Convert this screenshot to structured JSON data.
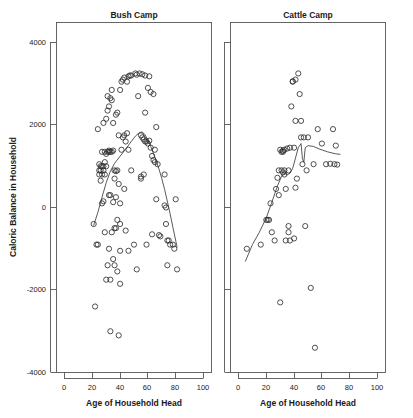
{
  "figure": {
    "background": "#ffffff",
    "point_color": "#303030",
    "line_color": "#303030",
    "axis_color": "#555555"
  },
  "chart_data": [
    {
      "type": "scatter",
      "title": "Bush Camp",
      "xlabel": "Age of Household Head",
      "ylabel": "Caloric Balance in Household",
      "xlim": [
        -4,
        108
      ],
      "ylim": [
        -4000,
        4400
      ],
      "xticks": [
        0,
        20,
        40,
        60,
        80,
        100
      ],
      "yticks": [
        4000,
        2000,
        0,
        -2000,
        -4000
      ],
      "ytick_labels": [
        "4000",
        "2000",
        "0",
        "-2000",
        "-4000"
      ],
      "xtick_labels": [
        "0",
        "20",
        "40",
        "60",
        "80",
        "100"
      ],
      "grid": false,
      "legend": "none",
      "marker": "open-circle",
      "points": [
        [
          21,
          -400
        ],
        [
          22,
          -2400
        ],
        [
          23,
          -900
        ],
        [
          24,
          -900
        ],
        [
          24,
          1900
        ],
        [
          25,
          800
        ],
        [
          25,
          900
        ],
        [
          25,
          1050
        ],
        [
          26,
          650
        ],
        [
          26,
          900
        ],
        [
          26,
          1000
        ],
        [
          27,
          100
        ],
        [
          27,
          800
        ],
        [
          27,
          1000
        ],
        [
          27,
          1350
        ],
        [
          28,
          150
        ],
        [
          28,
          900
        ],
        [
          28,
          1000
        ],
        [
          28,
          2050
        ],
        [
          29,
          -600
        ],
        [
          29,
          800
        ],
        [
          29,
          1100
        ],
        [
          29,
          1350
        ],
        [
          30,
          -1750
        ],
        [
          30,
          1000
        ],
        [
          30,
          1300
        ],
        [
          30,
          2150
        ],
        [
          31,
          -1400
        ],
        [
          31,
          1350
        ],
        [
          31,
          2700
        ],
        [
          31,
          2350
        ],
        [
          32,
          -1000
        ],
        [
          32,
          300
        ],
        [
          32,
          1350
        ],
        [
          32,
          1380
        ],
        [
          32,
          2450
        ],
        [
          33,
          -3000
        ],
        [
          33,
          -1750
        ],
        [
          33,
          300
        ],
        [
          33,
          1350
        ],
        [
          33,
          2650
        ],
        [
          34,
          -600
        ],
        [
          34,
          1350
        ],
        [
          34,
          2600
        ],
        [
          34,
          2850
        ],
        [
          35,
          -1250
        ],
        [
          35,
          130
        ],
        [
          35,
          1380
        ],
        [
          35,
          2050
        ],
        [
          36,
          -1400
        ],
        [
          36,
          700
        ],
        [
          36,
          900
        ],
        [
          36,
          -500
        ],
        [
          37,
          -500
        ],
        [
          37,
          250
        ],
        [
          37,
          880
        ],
        [
          37,
          2250
        ],
        [
          38,
          -1550
        ],
        [
          38,
          -300
        ],
        [
          38,
          900
        ],
        [
          38,
          2300
        ],
        [
          39,
          -3100
        ],
        [
          39,
          570
        ],
        [
          39,
          1750
        ],
        [
          40,
          -1850
        ],
        [
          40,
          -1050
        ],
        [
          40,
          -400
        ],
        [
          40,
          100
        ],
        [
          40,
          2850
        ],
        [
          41,
          1400
        ],
        [
          41,
          3050
        ],
        [
          42,
          1700
        ],
        [
          42,
          3100
        ],
        [
          43,
          450
        ],
        [
          43,
          1750
        ],
        [
          43,
          3150
        ],
        [
          44,
          -560
        ],
        [
          44,
          1600
        ],
        [
          45,
          1800
        ],
        [
          45,
          3050
        ],
        [
          46,
          -1050
        ],
        [
          46,
          1400
        ],
        [
          46,
          3180
        ],
        [
          47,
          3200
        ],
        [
          48,
          900
        ],
        [
          48,
          3200
        ],
        [
          50,
          -900
        ],
        [
          51,
          3250
        ],
        [
          52,
          -1500
        ],
        [
          52,
          3220
        ],
        [
          53,
          2700
        ],
        [
          54,
          3250
        ],
        [
          55,
          700
        ],
        [
          55,
          750
        ],
        [
          55,
          1750
        ],
        [
          56,
          1700
        ],
        [
          56,
          3230
        ],
        [
          57,
          800
        ],
        [
          57,
          1650
        ],
        [
          58,
          1600
        ],
        [
          58,
          2300
        ],
        [
          58,
          3200
        ],
        [
          59,
          -900
        ],
        [
          59,
          1600
        ],
        [
          60,
          1550
        ],
        [
          60,
          2900
        ],
        [
          61,
          1620
        ],
        [
          61,
          3180
        ],
        [
          62,
          1450
        ],
        [
          62,
          2800
        ],
        [
          63,
          1250
        ],
        [
          63,
          -650
        ],
        [
          64,
          1150
        ],
        [
          64,
          2750
        ],
        [
          65,
          1400
        ],
        [
          65,
          1100
        ],
        [
          66,
          200
        ],
        [
          66,
          1950
        ],
        [
          67,
          1050
        ],
        [
          68,
          -670
        ],
        [
          69,
          -700
        ],
        [
          72,
          50
        ],
        [
          72,
          800
        ],
        [
          73,
          0
        ],
        [
          73,
          -400
        ],
        [
          74,
          -1400
        ],
        [
          74,
          -800
        ],
        [
          75,
          -800
        ],
        [
          76,
          -900
        ],
        [
          78,
          -900
        ],
        [
          79,
          -1000
        ],
        [
          80,
          200
        ],
        [
          81,
          -1500
        ]
      ],
      "smoother": {
        "name": "loess",
        "points": [
          [
            21,
            -430
          ],
          [
            24,
            -120
          ],
          [
            27,
            250
          ],
          [
            30,
            600
          ],
          [
            33,
            880
          ],
          [
            36,
            1070
          ],
          [
            39,
            1200
          ],
          [
            42,
            1330
          ],
          [
            45,
            1460
          ],
          [
            48,
            1600
          ],
          [
            51,
            1730
          ],
          [
            54,
            1820
          ],
          [
            56,
            1830
          ],
          [
            58,
            1760
          ],
          [
            60,
            1640
          ],
          [
            62,
            1480
          ],
          [
            64,
            1310
          ],
          [
            66,
            1130
          ],
          [
            68,
            930
          ],
          [
            70,
            700
          ],
          [
            72,
            440
          ],
          [
            75,
            0
          ],
          [
            78,
            -480
          ],
          [
            81,
            -960
          ]
        ]
      }
    },
    {
      "type": "scatter",
      "title": "Cattle Camp",
      "xlabel": "Age of Household Head",
      "ylabel": "Caloric Balance in Household",
      "xlim": [
        -4,
        108
      ],
      "ylim": [
        -4000,
        4400
      ],
      "xticks": [
        0,
        20,
        40,
        60,
        80,
        100
      ],
      "yticks": [
        4000,
        2000,
        0,
        -2000,
        -4000
      ],
      "ytick_labels": [
        "4000",
        "2000",
        "0",
        "-2000",
        "-4000"
      ],
      "xtick_labels": [
        "0",
        "20",
        "40",
        "60",
        "80",
        "100"
      ],
      "grid": false,
      "legend": "none",
      "marker": "open-circle",
      "points": [
        [
          6,
          -1000
        ],
        [
          16,
          -900
        ],
        [
          20,
          -300
        ],
        [
          21,
          -300
        ],
        [
          22,
          -300
        ],
        [
          23,
          100
        ],
        [
          24,
          -600
        ],
        [
          26,
          -800
        ],
        [
          27,
          450
        ],
        [
          28,
          720
        ],
        [
          29,
          900
        ],
        [
          29,
          300
        ],
        [
          30,
          -2300
        ],
        [
          30,
          1400
        ],
        [
          31,
          900
        ],
        [
          31,
          1350
        ],
        [
          32,
          1350
        ],
        [
          32,
          1380
        ],
        [
          32,
          850
        ],
        [
          33,
          800
        ],
        [
          33,
          1400
        ],
        [
          33,
          900
        ],
        [
          34,
          450
        ],
        [
          34,
          -800
        ],
        [
          35,
          1430
        ],
        [
          36,
          -450
        ],
        [
          36,
          900
        ],
        [
          36,
          -600
        ],
        [
          37,
          1450
        ],
        [
          37,
          -800
        ],
        [
          38,
          2450
        ],
        [
          39,
          3050
        ],
        [
          39,
          3060
        ],
        [
          40,
          1450
        ],
        [
          40,
          -750
        ],
        [
          41,
          3100
        ],
        [
          41,
          2100
        ],
        [
          41,
          480
        ],
        [
          42,
          700
        ],
        [
          43,
          3250
        ],
        [
          44,
          2750
        ],
        [
          45,
          2100
        ],
        [
          45,
          1700
        ],
        [
          46,
          1050
        ],
        [
          47,
          1700
        ],
        [
          48,
          -450
        ],
        [
          49,
          900
        ],
        [
          50,
          1700
        ],
        [
          52,
          -1950
        ],
        [
          54,
          1050
        ],
        [
          55,
          -3400
        ],
        [
          57,
          1900
        ],
        [
          60,
          1550
        ],
        [
          63,
          1050
        ],
        [
          66,
          1060
        ],
        [
          68,
          1900
        ],
        [
          69,
          1050
        ],
        [
          70,
          1500
        ],
        [
          71,
          1040
        ]
      ],
      "smoother": {
        "name": "loess",
        "points": [
          [
            5,
            -1300
          ],
          [
            10,
            -900
          ],
          [
            15,
            -600
          ],
          [
            20,
            -250
          ],
          [
            24,
            130
          ],
          [
            28,
            520
          ],
          [
            31,
            760
          ],
          [
            33,
            830
          ],
          [
            35,
            790
          ],
          [
            37,
            830
          ],
          [
            39,
            950
          ],
          [
            41,
            1200
          ],
          [
            43,
            1450
          ],
          [
            45,
            1550
          ],
          [
            46,
            1180
          ],
          [
            47,
            1100
          ],
          [
            48,
            1450
          ],
          [
            50,
            1500
          ],
          [
            54,
            1480
          ],
          [
            58,
            1420
          ],
          [
            64,
            1350
          ],
          [
            70,
            1300
          ],
          [
            73,
            1290
          ]
        ]
      }
    }
  ]
}
